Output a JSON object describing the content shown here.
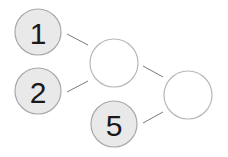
{
  "diagram": {
    "type": "number-bond-tree",
    "nodes": [
      {
        "id": "n1",
        "label": "1",
        "cx": 38,
        "cy": 32,
        "r": 23,
        "filled": true
      },
      {
        "id": "n2",
        "label": "2",
        "cx": 38,
        "cy": 91,
        "r": 23,
        "filled": true
      },
      {
        "id": "sum1",
        "label": "",
        "cx": 114,
        "cy": 63,
        "r": 24,
        "filled": false
      },
      {
        "id": "n5",
        "label": "5",
        "cx": 114,
        "cy": 124,
        "r": 23,
        "filled": true
      },
      {
        "id": "sum2",
        "label": "",
        "cx": 188,
        "cy": 95,
        "r": 24,
        "filled": false
      }
    ],
    "edges": [
      {
        "from": "n1",
        "to": "sum1",
        "x1": 67,
        "y1": 34,
        "x2": 88,
        "y2": 45
      },
      {
        "from": "n2",
        "to": "sum1",
        "x1": 67,
        "y1": 92,
        "x2": 88,
        "y2": 81
      },
      {
        "from": "sum1",
        "to": "sum2",
        "x1": 143,
        "y1": 66,
        "x2": 163,
        "y2": 77
      },
      {
        "from": "n5",
        "to": "sum2",
        "x1": 143,
        "y1": 123,
        "x2": 163,
        "y2": 112
      }
    ],
    "colors": {
      "filled_fill": "#e9e9e9",
      "filled_stroke": "#a8a8a8",
      "empty_fill": "#ffffff",
      "empty_stroke": "#b8b8b8",
      "edge": "#7a7a7a",
      "text": "#1a1a1a"
    }
  }
}
